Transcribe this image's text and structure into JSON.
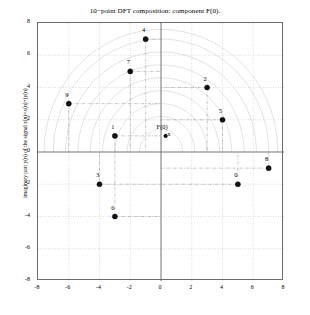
{
  "chart_data": {
    "type": "scatter",
    "title": "10−point DFT composition: component F(0).",
    "xlabel": "",
    "ylabel": "imaginary part y(n) of the signal z(n)=x(n)+jy(n)",
    "xlim": [
      -8,
      8
    ],
    "ylim": [
      -8,
      8
    ],
    "xticks": [
      "-8",
      "-6",
      "-4",
      "-2",
      "0",
      "2",
      "4",
      "6",
      "8"
    ],
    "xtick_values": [
      -8,
      -6,
      -4,
      -2,
      0,
      2,
      4,
      6,
      8
    ],
    "yticks": [
      "-8",
      "-6",
      "-4",
      "-2",
      "0",
      "2",
      "4",
      "6",
      "8"
    ],
    "ytick_values": [
      -8,
      -6,
      -4,
      -2,
      0,
      2,
      4,
      6,
      8
    ],
    "grid": true,
    "legend": false,
    "points": [
      {
        "label": "0",
        "x": 5,
        "y": -2
      },
      {
        "label": "1",
        "x": -3,
        "y": 1
      },
      {
        "label": "2",
        "x": 3,
        "y": 4
      },
      {
        "label": "3",
        "x": -4,
        "y": -2
      },
      {
        "label": "4",
        "x": -1,
        "y": 7
      },
      {
        "label": "5",
        "x": 4,
        "y": 2
      },
      {
        "label": "6",
        "x": -3,
        "y": -4
      },
      {
        "label": "7",
        "x": -2,
        "y": 5
      },
      {
        "label": "8",
        "x": 7,
        "y": -1
      },
      {
        "label": "9",
        "x": -6,
        "y": 3
      }
    ],
    "annotations": [
      {
        "label": "F(0)",
        "x": 0.3,
        "y": 1,
        "marker": "x"
      }
    ]
  }
}
